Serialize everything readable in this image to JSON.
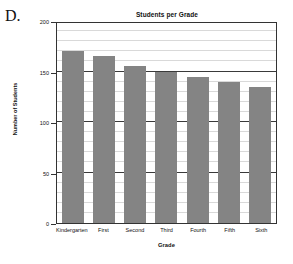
{
  "panel": {
    "letter": "D."
  },
  "chart_data": {
    "type": "bar",
    "title": "Students per Grade",
    "xlabel": "Grade",
    "ylabel": "Number of Students",
    "categories": [
      "Kindergarten",
      "First",
      "Second",
      "Third",
      "Fourth",
      "Fifth",
      "Sixth"
    ],
    "values": [
      170,
      165,
      155,
      150,
      145,
      140,
      135
    ],
    "ylim": [
      0,
      200
    ],
    "ytick_labels": [
      "0",
      "50",
      "100",
      "150",
      "200"
    ],
    "ytick_values": [
      0,
      50,
      100,
      150,
      200
    ],
    "minor_tick_step": 10,
    "grid": true,
    "legend": "none",
    "bar_color": "#848484",
    "major_gridline_color": "#3a3a3a",
    "minor_gridline_color": "#d9d9d9",
    "background_color": "#ffffff"
  }
}
